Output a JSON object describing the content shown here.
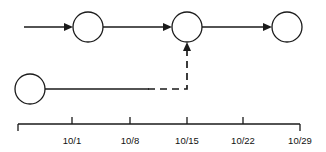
{
  "diagram": {
    "type": "network-schedule",
    "stroke_color": "#1a1a1a",
    "background_color": "#ffffff",
    "nodes": [
      {
        "id": "n1",
        "label": "",
        "cx": 88,
        "cy": 27,
        "r": 15,
        "row": "top"
      },
      {
        "id": "n2",
        "label": "",
        "cx": 187,
        "cy": 27,
        "r": 15,
        "row": "top"
      },
      {
        "id": "n3",
        "label": "",
        "cx": 287,
        "cy": 27,
        "r": 15,
        "row": "top"
      },
      {
        "id": "n4",
        "label": "",
        "cx": 30,
        "cy": 89,
        "r": 15,
        "row": "bottom"
      }
    ],
    "edges": [
      {
        "id": "e1",
        "from": "start",
        "to": "n1",
        "style": "solid",
        "orientation": "horizontal",
        "arrow": true
      },
      {
        "id": "e2",
        "from": "n1",
        "to": "n2",
        "style": "solid",
        "orientation": "horizontal",
        "arrow": true
      },
      {
        "id": "e3",
        "from": "n2",
        "to": "n3",
        "style": "solid",
        "orientation": "horizontal",
        "arrow": true
      },
      {
        "id": "e4",
        "from": "n4",
        "to": "slack",
        "style": "solid",
        "orientation": "horizontal",
        "arrow": false
      },
      {
        "id": "e5",
        "from": "slack",
        "to": "n2",
        "style": "dashed",
        "orientation": "elbow",
        "arrow": true
      }
    ]
  },
  "axis": {
    "label": "",
    "start_x": 18,
    "end_x": 300,
    "y": 124,
    "tick_length": 6,
    "ticks": [
      {
        "label": "",
        "x": 18,
        "show_label": false
      },
      {
        "label": "10/1",
        "x": 72,
        "show_label": true
      },
      {
        "label": "10/8",
        "x": 130,
        "show_label": true
      },
      {
        "label": "10/15",
        "x": 187,
        "show_label": true
      },
      {
        "label": "10/22",
        "x": 243,
        "show_label": true
      },
      {
        "label": "10/29",
        "x": 300,
        "show_label": true
      }
    ]
  }
}
